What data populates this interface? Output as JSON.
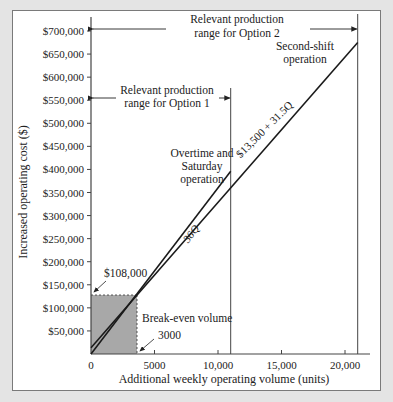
{
  "chart_data": {
    "type": "line",
    "title": "",
    "xlabel": "Additional weekly operating volume (units)",
    "ylabel": "Increased operating cost ($)",
    "xlim": [
      0,
      22000
    ],
    "ylim": [
      0,
      700000
    ],
    "x_ticks": [
      {
        "value": 0,
        "label": "0"
      },
      {
        "value": 5000,
        "label": "5000"
      },
      {
        "value": 10000,
        "label": "10,000"
      },
      {
        "value": 15000,
        "label": "15,000"
      },
      {
        "value": 20000,
        "label": "20,000"
      }
    ],
    "y_ticks": [
      {
        "value": 50000,
        "label": "$50,000"
      },
      {
        "value": 100000,
        "label": "$100,000"
      },
      {
        "value": 150000,
        "label": "$150,000"
      },
      {
        "value": 200000,
        "label": "$200,000"
      },
      {
        "value": 250000,
        "label": "$250,000"
      },
      {
        "value": 300000,
        "label": "$300,000"
      },
      {
        "value": 350000,
        "label": "$350,000"
      },
      {
        "value": 400000,
        "label": "$400,000"
      },
      {
        "value": 450000,
        "label": "$450,000"
      },
      {
        "value": 500000,
        "label": "$500,000"
      },
      {
        "value": 550000,
        "label": "$550,000"
      },
      {
        "value": 600000,
        "label": "$600,000"
      },
      {
        "value": 650000,
        "label": "$650,000"
      },
      {
        "value": 700000,
        "label": "$700,000"
      }
    ],
    "grid": false,
    "series": [
      {
        "name": "Overtime and Saturday operation",
        "equation_label": "36Q",
        "x": [
          0,
          11000
        ],
        "y": [
          0,
          396000
        ]
      },
      {
        "name": "Second-shift operation",
        "equation_label": "$13,500 + 31.5Q",
        "x": [
          0,
          21000
        ],
        "y": [
          13500,
          675000
        ]
      }
    ],
    "annotations": {
      "option2_range": {
        "label_line1": "Relevant production",
        "label_line2": "range for Option 2",
        "x_end": 21000
      },
      "option1_range": {
        "label_line1": "Relevant production",
        "label_line2": "range for Option 1",
        "x_end": 11000
      },
      "overtime_label": [
        "Overtime and",
        "Saturday",
        "operation"
      ],
      "second_shift_label": [
        "Second-shift",
        "operation"
      ],
      "break_even_cost": "$108,000",
      "break_even_label": "Break-even volume",
      "break_even_volume": "3000",
      "break_even_point": {
        "x": 3000,
        "y": 108000
      }
    }
  }
}
